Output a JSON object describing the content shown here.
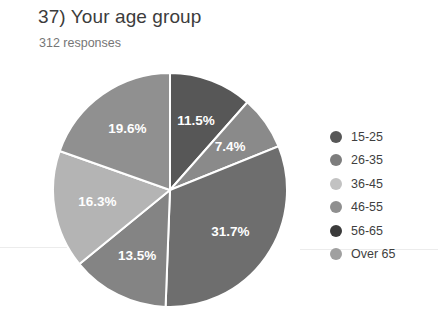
{
  "header": {
    "title": "37) Your age group",
    "response_count": "312 responses"
  },
  "chart_data": {
    "type": "pie",
    "title": "37) Your age group",
    "subtitle": "312 responses",
    "total_responses": 312,
    "legend_position": "right",
    "start_angle_deg": 0,
    "direction": "clockwise",
    "categories": [
      "15-25",
      "26-35",
      "36-45",
      "46-55",
      "56-65",
      "Over 65"
    ],
    "values": [
      11.5,
      7.4,
      31.7,
      13.5,
      16.3,
      19.6
    ],
    "value_labels": [
      "11.5%",
      "7.4%",
      "31.7%",
      "13.5%",
      "16.3%",
      "19.6%"
    ],
    "colors": [
      "#575757",
      "#8a8a8a",
      "#6e6e6e",
      "#848484",
      "#3b3b3b",
      "#9b9b9b"
    ],
    "legend_colors": [
      "#575757",
      "#7d7d7d",
      "#c2c2c2",
      "#8f8f8f",
      "#3b3b3b",
      "#a0a0a0"
    ],
    "slices": [
      {
        "label": "15-25",
        "value": 11.5,
        "value_label": "11.5%",
        "color": "#575757",
        "legend_color": "#575757"
      },
      {
        "label": "26-35",
        "value": 7.4,
        "value_label": "7.4%",
        "color": "#8a8a8a",
        "legend_color": "#7d7d7d"
      },
      {
        "label": "36-45",
        "value": 31.7,
        "value_label": "31.7%",
        "color": "#6e6e6e",
        "legend_color": "#c2c2c2"
      },
      {
        "label": "46-55",
        "value": 13.5,
        "value_label": "13.5%",
        "color": "#848484",
        "legend_color": "#8f8f8f"
      },
      {
        "label": "56-65",
        "value": 16.3,
        "value_label": "16.3%",
        "color": "#b4b4b4",
        "legend_color": "#3b3b3b"
      },
      {
        "label": "Over 65",
        "value": 19.6,
        "value_label": "19.6%",
        "color": "#909090",
        "legend_color": "#a0a0a0"
      }
    ],
    "units": "percent",
    "grid": false
  },
  "legend": {
    "items": [
      {
        "label": "15-25"
      },
      {
        "label": "26-35"
      },
      {
        "label": "36-45"
      },
      {
        "label": "46-55"
      },
      {
        "label": "56-65"
      },
      {
        "label": "Over 65"
      }
    ]
  }
}
